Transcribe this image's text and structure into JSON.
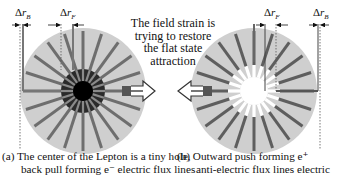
{
  "figure": {
    "center_annotation": {
      "lines": [
        "The field strain is",
        "trying to restore",
        "the flat state",
        "attraction"
      ]
    },
    "panel_a": {
      "caption_line1": "(a) The center of the Lepton is a tiny hole,",
      "caption_line2": "back pull forming e⁻ electric flux lines",
      "label_outer": {
        "delta": "Δ",
        "symbol": "r",
        "sub": "B"
      },
      "label_inner": {
        "delta": "Δ",
        "symbol": "r",
        "sub": "F"
      },
      "center_style": "dark core with black hole",
      "arrow_direction": "right"
    },
    "panel_b": {
      "caption_line1": "(b) Outward push forming e⁺",
      "caption_line2": "anti-electric flux lines electric",
      "label_inner": {
        "delta": "Δ",
        "symbol": "r",
        "sub": "F"
      },
      "label_outer": {
        "delta": "Δ",
        "symbol": "r",
        "sub": "B"
      },
      "center_style": "white hole",
      "arrow_direction": "left"
    },
    "colors": {
      "disk_fill": "#cfcfcf",
      "ray": "#6e6e6e",
      "core_dark": "#2a2a2a",
      "core_black": "#000000",
      "hole_white": "#ffffff",
      "text": "#111111"
    },
    "ray_count": 20
  }
}
